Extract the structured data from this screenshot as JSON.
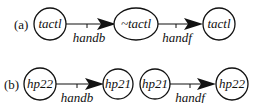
{
  "diagram": {
    "type": "state-transition",
    "panels": [
      {
        "label": "(a)",
        "nodes": [
          {
            "id": "a1",
            "label": "tactl",
            "shape": "circle"
          },
          {
            "id": "a2",
            "label": "~tactl",
            "shape": "ellipse"
          },
          {
            "id": "a3",
            "label": "tactl",
            "shape": "circle"
          }
        ],
        "edges": [
          {
            "from": "a1",
            "to": "a2",
            "label": "handb"
          },
          {
            "from": "a2",
            "to": "a3",
            "label": "handf"
          }
        ]
      },
      {
        "label": "(b)",
        "nodes": [
          {
            "id": "b1",
            "label": "hp22",
            "shape": "circle"
          },
          {
            "id": "b2",
            "label": "hp21",
            "shape": "circle"
          },
          {
            "id": "b3",
            "label": "hp21",
            "shape": "circle"
          },
          {
            "id": "b4",
            "label": "hp22",
            "shape": "circle"
          }
        ],
        "edges": [
          {
            "from": "b1",
            "to": "b2",
            "label": "handb"
          },
          {
            "from": "b3",
            "to": "b4",
            "label": "handf"
          }
        ]
      }
    ]
  }
}
